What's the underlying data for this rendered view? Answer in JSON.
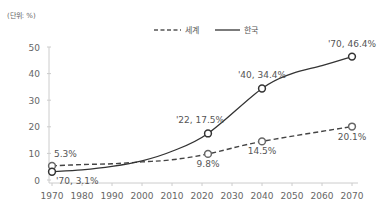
{
  "unit_label": "(단위: %)",
  "legend": [
    {
      "name": "세계",
      "style": "dashed"
    },
    {
      "name": "한국",
      "style": "solid"
    }
  ],
  "chart_data": {
    "type": "line",
    "title": "",
    "unit": "(단위: %)",
    "xlabel": "",
    "ylabel": "",
    "xlim": [
      1970,
      2070
    ],
    "ylim": [
      0,
      50
    ],
    "x_ticks": [
      "1970",
      "1980",
      "1990",
      "2000",
      "2010",
      "2020",
      "2030",
      "2040",
      "2050",
      "2060",
      "2070"
    ],
    "y_ticks": [
      "0",
      "10",
      "20",
      "30",
      "40",
      "50"
    ],
    "grid": false,
    "legend_position": "top-center",
    "series": [
      {
        "name": "세계",
        "line": "dashed",
        "points": [
          {
            "x": 1970,
            "y": 5.3,
            "label": "5.3%"
          },
          {
            "x": 1980,
            "y": 5.8
          },
          {
            "x": 1990,
            "y": 6.1
          },
          {
            "x": 2000,
            "y": 6.8
          },
          {
            "x": 2010,
            "y": 7.6
          },
          {
            "x": 2022,
            "y": 9.8,
            "label": "9.8%"
          },
          {
            "x": 2040,
            "y": 14.5,
            "label": "14.5%"
          },
          {
            "x": 2070,
            "y": 20.1,
            "label": "20.1%"
          }
        ]
      },
      {
        "name": "한국",
        "line": "solid",
        "points": [
          {
            "x": 1970,
            "y": 3.1,
            "label": "'70, 3.1%"
          },
          {
            "x": 1980,
            "y": 3.8
          },
          {
            "x": 1990,
            "y": 5.1
          },
          {
            "x": 2000,
            "y": 7.2
          },
          {
            "x": 2010,
            "y": 10.8
          },
          {
            "x": 2022,
            "y": 17.5,
            "label": "'22, 17.5%"
          },
          {
            "x": 2040,
            "y": 34.4,
            "label": "'40, 34.4%"
          },
          {
            "x": 2050,
            "y": 40.0
          },
          {
            "x": 2060,
            "y": 43.0
          },
          {
            "x": 2070,
            "y": 46.4,
            "label": "'70, 46.4%"
          }
        ]
      }
    ]
  }
}
